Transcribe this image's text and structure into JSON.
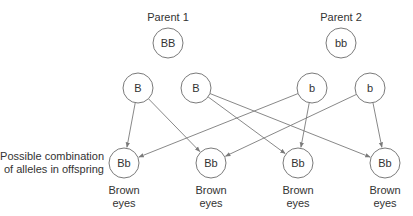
{
  "parents": [
    {
      "label": "Parent 1",
      "genotype": "BB",
      "x": 168,
      "y": 43
    },
    {
      "label": "Parent 2",
      "genotype": "bb",
      "x": 341,
      "y": 43
    }
  ],
  "gametes": [
    {
      "allele": "B",
      "x": 138,
      "y": 88
    },
    {
      "allele": "B",
      "x": 196,
      "y": 88
    },
    {
      "allele": "b",
      "x": 312,
      "y": 88
    },
    {
      "allele": "b",
      "x": 370,
      "y": 88
    }
  ],
  "offspring": [
    {
      "genotype": "Bb",
      "phenotype_line1": "Brown",
      "phenotype_line2": "eyes",
      "x": 124,
      "y": 163
    },
    {
      "genotype": "Bb",
      "phenotype_line1": "Brown",
      "phenotype_line2": "eyes",
      "x": 211,
      "y": 163
    },
    {
      "genotype": "Bb",
      "phenotype_line1": "Brown",
      "phenotype_line2": "eyes",
      "x": 298,
      "y": 163
    },
    {
      "genotype": "Bb",
      "phenotype_line1": "Brown",
      "phenotype_line2": "eyes",
      "x": 385,
      "y": 163
    }
  ],
  "edges": [
    {
      "from": 0,
      "to": 0
    },
    {
      "from": 0,
      "to": 1
    },
    {
      "from": 1,
      "to": 2
    },
    {
      "from": 1,
      "to": 3
    },
    {
      "from": 2,
      "to": 0
    },
    {
      "from": 2,
      "to": 2
    },
    {
      "from": 3,
      "to": 1
    },
    {
      "from": 3,
      "to": 3
    }
  ],
  "side_label": {
    "line1": "Possible combination",
    "line2": "of alleles in offspring"
  },
  "colors": {
    "stroke": "#7a7a7a",
    "text": "#333333"
  }
}
